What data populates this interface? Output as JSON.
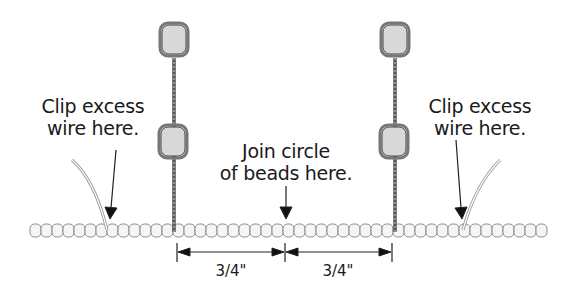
{
  "diagram": {
    "labels": {
      "left_clip": [
        "Clip excess",
        "wire here."
      ],
      "right_clip": [
        "Clip excess",
        "wire here."
      ],
      "join": [
        "Join circle",
        "of beads here."
      ]
    },
    "dimensions": {
      "left_span": "3/4\"",
      "right_span": "3/4\""
    },
    "colors": {
      "line": "#333333",
      "bead_fill": "#f4f4f4",
      "bead_stroke": "#8a8a8a",
      "large_bead_fill": "#d9d9d9",
      "wire_fill": "#ffffff"
    }
  }
}
